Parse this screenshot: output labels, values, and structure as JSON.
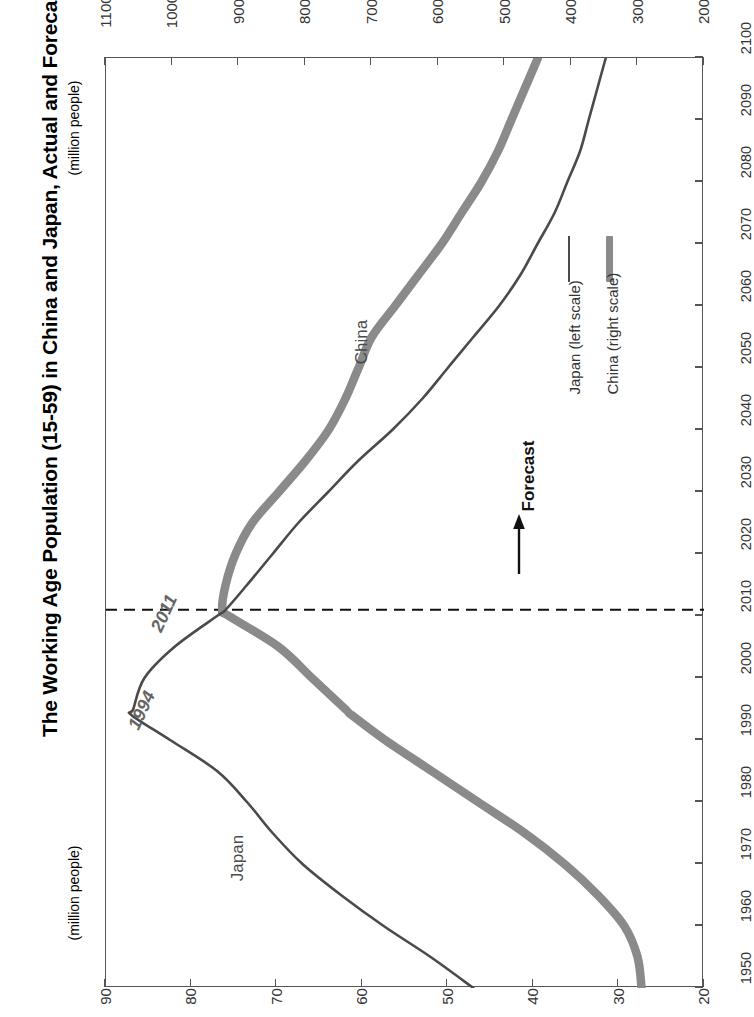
{
  "title": "The Working Age Population (15-59) in China and Japan, Actual and Forecast",
  "axis_captions": {
    "china_scale": "(million people)",
    "japan_scale": "(million people)"
  },
  "curve_labels": {
    "japan": "Japan",
    "china": "China"
  },
  "annotations": {
    "japan_peak_year": "1994",
    "china_peak_year": "2011",
    "forecast": "Forecast"
  },
  "legend": {
    "items": [
      {
        "label": "Japan (left scale)",
        "style": "thin",
        "color": "#4a4a4a"
      },
      {
        "label": "China (right scale)",
        "style": "thick",
        "color": "#8a8a8a"
      }
    ]
  },
  "chart_data": {
    "type": "line",
    "title": "The Working Age Population (15-59) in China and Japan, Actual and Forecast",
    "orientation": "rotated-90-ccw",
    "xlabel": "",
    "ylabel": "(million people)",
    "grid": false,
    "legend_position": "center-right",
    "forecast_divider_year": 2011,
    "x": [
      1950,
      1955,
      1960,
      1965,
      1970,
      1975,
      1980,
      1985,
      1990,
      1994,
      1995,
      2000,
      2005,
      2010,
      2011,
      2015,
      2020,
      2025,
      2030,
      2035,
      2040,
      2045,
      2050,
      2055,
      2060,
      2065,
      2070,
      2075,
      2080,
      2085,
      2090,
      2095,
      2100
    ],
    "x_ticks": [
      1950,
      1960,
      1970,
      1980,
      1990,
      2000,
      2010,
      2020,
      2030,
      2040,
      2050,
      2060,
      2070,
      2080,
      2090,
      2100
    ],
    "series": [
      {
        "name": "Japan (left scale)",
        "axis": "left",
        "axis_label": "(million people)",
        "ylim": [
          20,
          90
        ],
        "y_ticks": [
          90,
          80,
          70,
          60,
          50,
          40,
          30,
          20
        ],
        "color": "#4a4a4a",
        "line_width": "thin",
        "peak_year": 1994,
        "peak_value": 87,
        "values": [
          47.0,
          52.0,
          57.5,
          62.5,
          67.0,
          70.5,
          73.5,
          77.0,
          82.5,
          87.0,
          86.8,
          85.5,
          82.0,
          77.0,
          76.0,
          73.5,
          70.5,
          67.5,
          64.0,
          60.5,
          56.5,
          53.0,
          50.0,
          47.0,
          44.0,
          41.5,
          39.5,
          37.5,
          36.0,
          34.5,
          33.5,
          32.5,
          31.5
        ]
      },
      {
        "name": "China (right scale)",
        "axis": "right",
        "axis_label": "(million people)",
        "ylim": [
          200,
          1100
        ],
        "y_ticks": [
          1100,
          1000,
          900,
          800,
          700,
          600,
          500,
          400,
          300,
          200
        ],
        "color": "#8a8a8a",
        "line_width": "thick",
        "peak_year": 2011,
        "peak_value": 925,
        "values": [
          294,
          300,
          320,
          360,
          410,
          470,
          540,
          610,
          680,
          730,
          740,
          790,
          840,
          915,
          925,
          920,
          905,
          880,
          840,
          800,
          765,
          740,
          720,
          700,
          665,
          630,
          595,
          565,
          535,
          510,
          490,
          470,
          450
        ]
      }
    ],
    "annotations": [
      {
        "text": "1994",
        "meaning": "Japan working-age population peak",
        "value": 87,
        "series": "Japan (left scale)"
      },
      {
        "text": "2011",
        "meaning": "China working-age population peak",
        "value": 925,
        "series": "China (right scale)"
      },
      {
        "text": "Forecast",
        "meaning": "Years after 2011 are projected",
        "from_year": 2011
      }
    ]
  }
}
